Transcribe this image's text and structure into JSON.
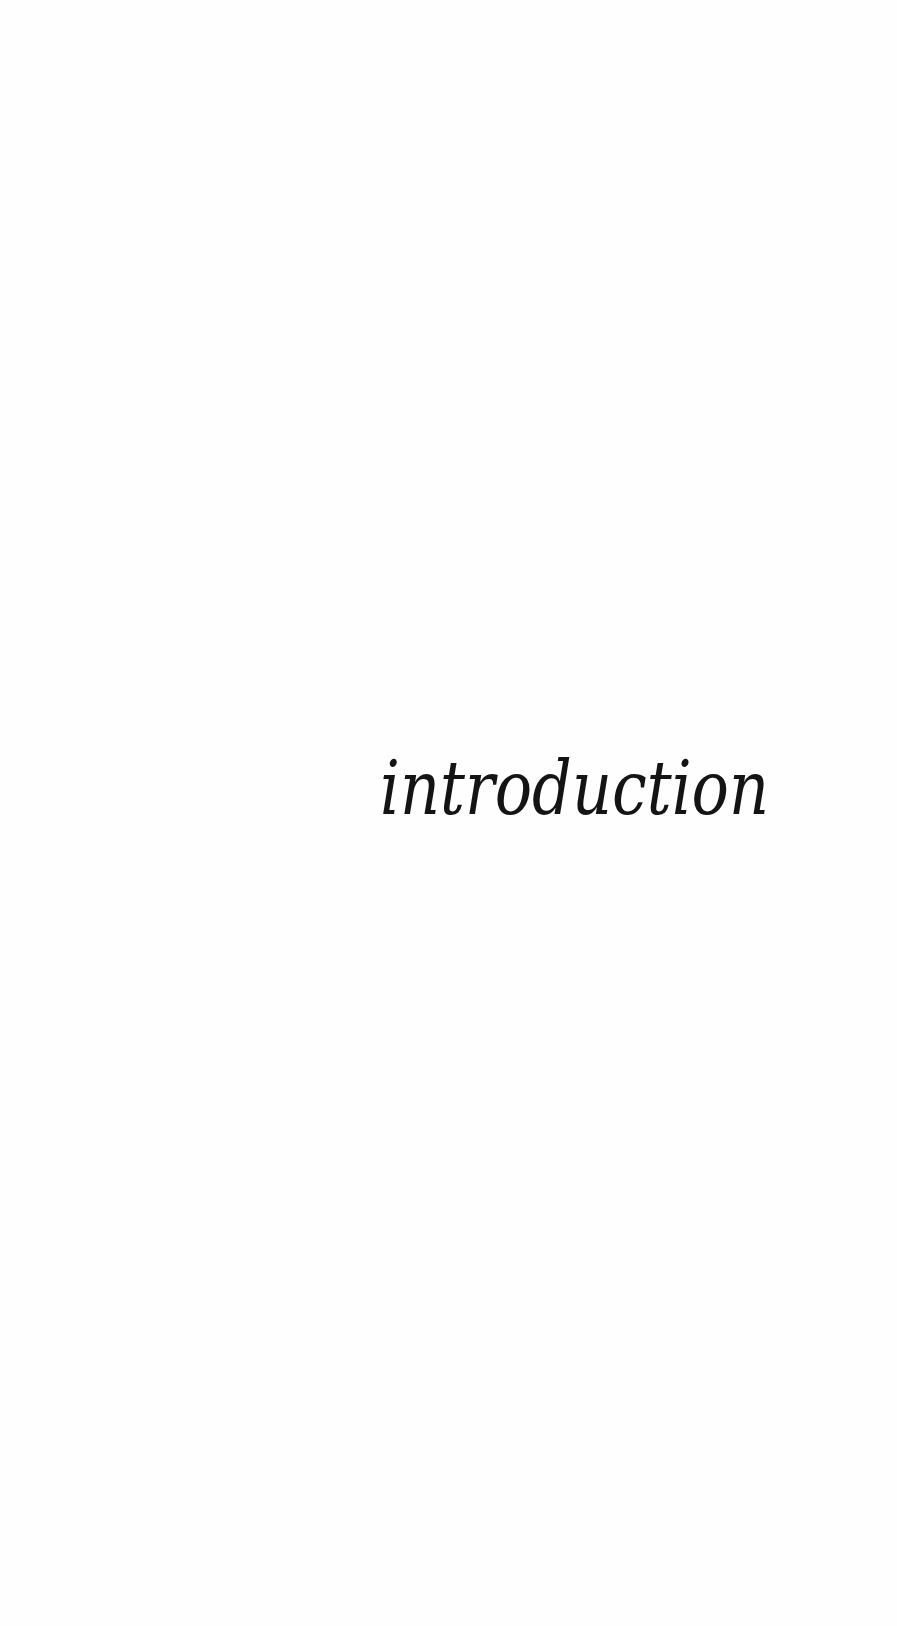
{
  "page": {
    "section_title": "introduction",
    "background_color": "#fefefe",
    "text_color": "#141414"
  }
}
